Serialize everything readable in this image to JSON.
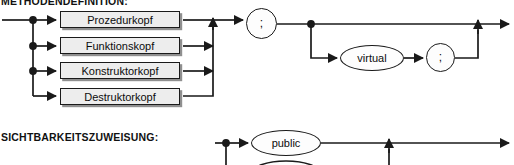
{
  "diagram": {
    "kind": "syntax-railroad-diagram",
    "ink": "#1a1a1a",
    "box_fill": "#ededed",
    "node_fill": "#fdfdfd",
    "shadow": "#8f8f8f"
  },
  "rules": [
    {
      "label": "METHODENDEFINITION:",
      "alternatives": [
        "Prozedurkopf",
        "Funktionskopf",
        "Konstruktorkopf",
        "Destruktorkopf"
      ],
      "terminals": {
        "semicolon": ";",
        "virtual": "virtual",
        "semicolon2": ";"
      }
    },
    {
      "label": "SICHTBARKEITSZUWEISUNG:",
      "alternatives": [
        "public"
      ]
    }
  ],
  "boxes": [
    {
      "text": "Prozedurkopf",
      "x": 60,
      "y": 11,
      "w": 120,
      "h": 17
    },
    {
      "text": "Funktionskopf",
      "x": 60,
      "y": 37,
      "w": 120,
      "h": 17
    },
    {
      "text": "Konstruktorkopf",
      "x": 60,
      "y": 62,
      "w": 120,
      "h": 17
    },
    {
      "text": "Destruktorkopf",
      "x": 60,
      "y": 88,
      "w": 120,
      "h": 17
    }
  ],
  "nodes": [
    {
      "text": ";",
      "shape": "circle",
      "x": 246,
      "y": 8,
      "w": 31,
      "h": 31
    },
    {
      "text": "virtual",
      "shape": "ellipse",
      "x": 340,
      "y": 45,
      "w": 64,
      "h": 26
    },
    {
      "text": ";",
      "shape": "circle",
      "x": 426,
      "y": 43,
      "w": 29,
      "h": 29
    },
    {
      "text": "public",
      "shape": "ellipse",
      "x": 251,
      "y": 130,
      "w": 70,
      "h": 26
    }
  ]
}
